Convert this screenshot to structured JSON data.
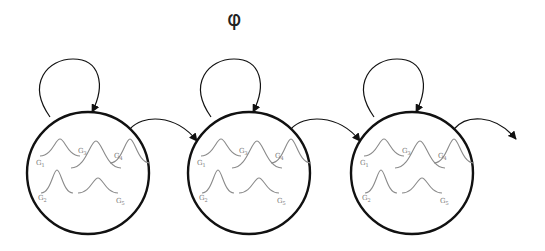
{
  "title": "φ",
  "states": [
    {
      "id": "state-1",
      "cx": 88,
      "cy": 173,
      "r": 61,
      "gaussians": [
        {
          "label": "G1",
          "sub": "1"
        },
        {
          "label": "G3",
          "sub": "3"
        },
        {
          "label": "G4",
          "sub": "4"
        },
        {
          "label": "G2",
          "sub": "2"
        },
        {
          "label": "G5",
          "sub": "5"
        }
      ]
    },
    {
      "id": "state-2",
      "cx": 249,
      "cy": 173,
      "r": 61,
      "gaussians": [
        {
          "label": "G1",
          "sub": "1"
        },
        {
          "label": "G3",
          "sub": "3"
        },
        {
          "label": "G4",
          "sub": "4"
        },
        {
          "label": "G2",
          "sub": "2"
        },
        {
          "label": "G5",
          "sub": "5"
        }
      ]
    },
    {
      "id": "state-3",
      "cx": 412,
      "cy": 173,
      "r": 61,
      "gaussians": [
        {
          "label": "G1",
          "sub": "1"
        },
        {
          "label": "G3",
          "sub": "3"
        },
        {
          "label": "G4",
          "sub": "4"
        },
        {
          "label": "G2",
          "sub": "2"
        },
        {
          "label": "G5",
          "sub": "5"
        }
      ]
    }
  ],
  "edges": [
    {
      "type": "self-loop",
      "state": "state-1"
    },
    {
      "type": "self-loop",
      "state": "state-2"
    },
    {
      "type": "self-loop",
      "state": "state-3"
    },
    {
      "type": "transition",
      "from": "state-1",
      "to": "state-2"
    },
    {
      "type": "transition",
      "from": "state-2",
      "to": "state-3"
    },
    {
      "type": "transition",
      "from": "state-3",
      "to": "next"
    }
  ],
  "colors": {
    "stroke": "#111111",
    "gaussian": "#8a8a8a"
  }
}
